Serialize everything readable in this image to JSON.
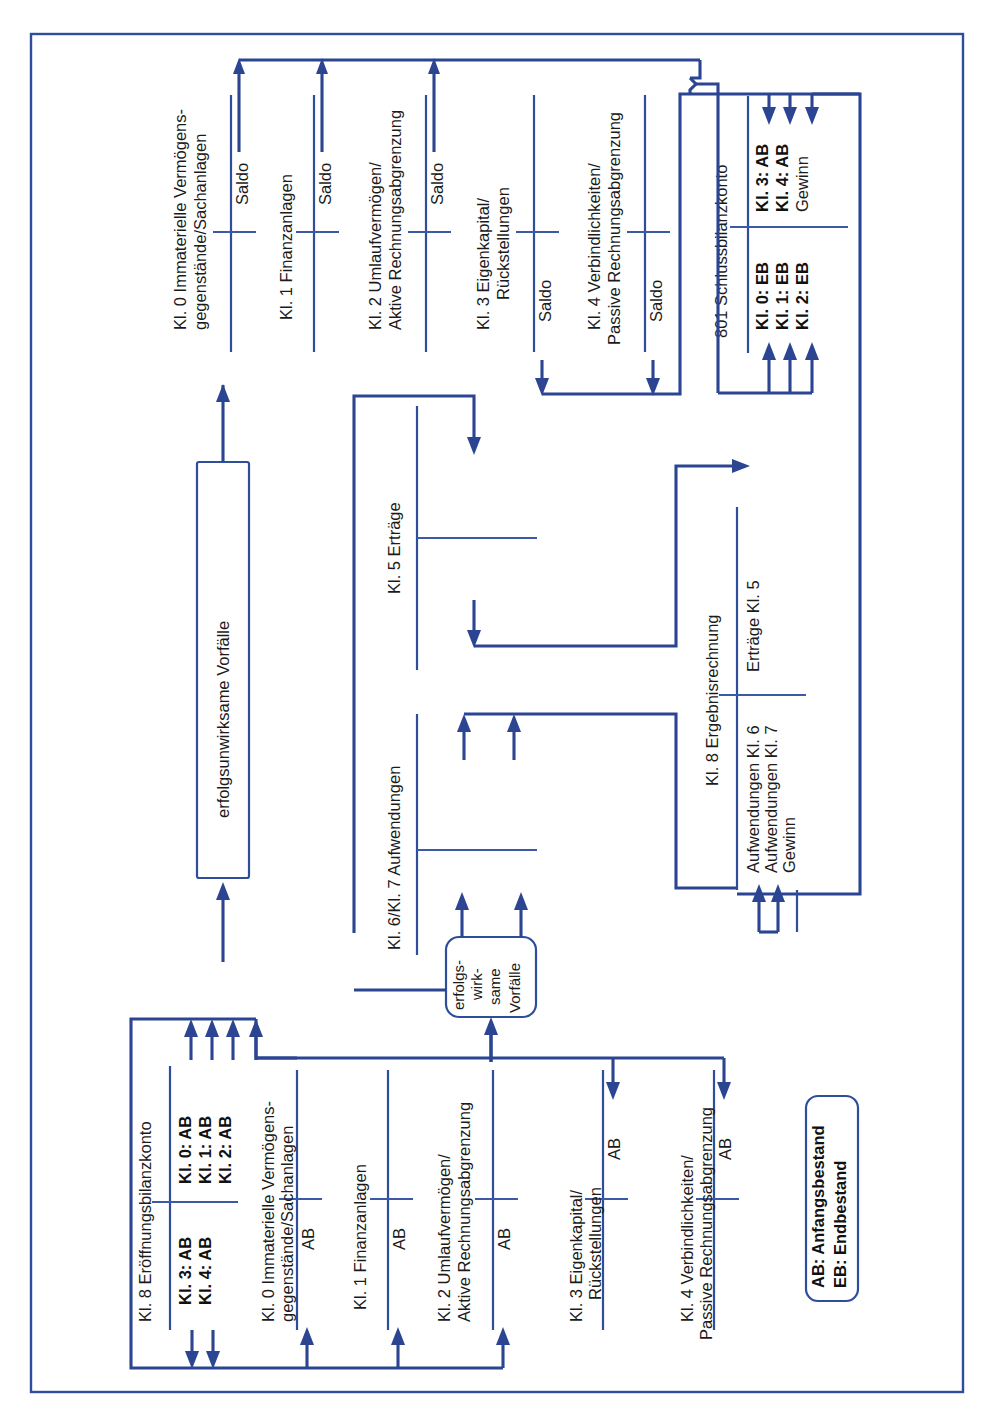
{
  "diagram": {
    "title_visible": false,
    "accent_color": "#2e4d9b",
    "text_color": "#1b1b1b",
    "background": "#ffffff",
    "legend": {
      "line1": "AB: Anfangsbestand",
      "line2": "EB: Endbestand"
    },
    "process_boxes": {
      "erfolgsunwirksam": "erfolgsunwirksame Vorfälle",
      "erfolgswirksam_l1": "erfolgs-",
      "erfolgswirksam_l2": "wirk-",
      "erfolgswirksam_l3": "same",
      "erfolgswirksam_l4": "Vorfälle"
    },
    "top_accounts": [
      {
        "name": "Kl. 0 Immaterielle Vermögens-",
        "name2": "gegenstände/Sachanlagen",
        "entry": "Saldo"
      },
      {
        "name": "Kl. 1 Finanzanlagen",
        "name2": "",
        "entry": "Saldo"
      },
      {
        "name": "Kl. 2 Umlaufvermögen/",
        "name2": "Aktive Rechnungsabgrenzung",
        "entry": "Saldo"
      },
      {
        "name": "Kl. 3 Eigenkapital/",
        "name2": "Rückstellungen",
        "entry": "Saldo"
      },
      {
        "name": "Kl. 4 Verbindlichkeiten/",
        "name2": "Passive Rechnungsabgrenzung",
        "entry": "Saldo"
      }
    ],
    "closing_account": {
      "name": "801 Schlussbilanzkonto",
      "debit": [
        "Kl. 0: EB",
        "Kl. 1: EB",
        "Kl. 2: EB"
      ],
      "credit": [
        "Kl. 3: AB",
        "Kl. 4: AB",
        "Gewinn"
      ]
    },
    "pl_accounts": [
      {
        "name": "Kl. 5 Erträge"
      },
      {
        "name": "Kl. 6/Kl. 7 Aufwendungen"
      }
    ],
    "result_account": {
      "name": "Kl. 8 Ergebnisrechnung",
      "debit": [
        "Aufwendungen Kl. 6",
        "Aufwendungen Kl. 7",
        "Gewinn"
      ],
      "credit": [
        "Erträge Kl. 5"
      ]
    },
    "opening_account": {
      "name": "Kl. 8 Eröffnungsbilanzkonto",
      "debit": [
        "Kl. 3: AB",
        "Kl. 4: AB"
      ],
      "credit": [
        "Kl. 0: AB",
        "Kl. 1: AB",
        "Kl. 2: AB"
      ]
    },
    "bottom_accounts": [
      {
        "name": "Kl. 0 Immaterielle Vermögens-",
        "name2": "gegenstände/Sachanlagen",
        "entry": "AB"
      },
      {
        "name": "Kl. 1 Finanzanlagen",
        "name2": "",
        "entry": "AB"
      },
      {
        "name": "Kl. 2 Umlaufvermögen/",
        "name2": "Aktive Rechnungsabgrenzung",
        "entry": "AB"
      },
      {
        "name": "Kl. 3 Eigenkapital/",
        "name2": "Rückstellungen",
        "entry": "AB"
      },
      {
        "name": "Kl. 4 Verbindlichkeiten/",
        "name2": "Passive Rechnungsabgrenzung",
        "entry": "AB"
      }
    ]
  }
}
